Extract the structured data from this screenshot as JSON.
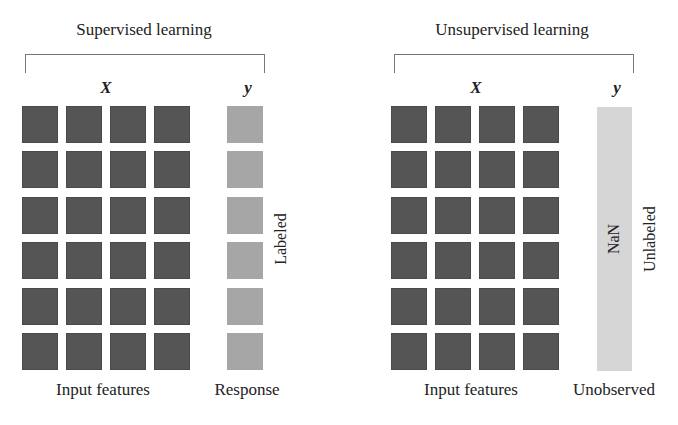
{
  "panels": [
    {
      "title": "Supervised learning",
      "x_label": "X",
      "y_label": "y",
      "feature_columns": 4,
      "rows": 6,
      "response_caption": "Response",
      "features_caption": "Input features",
      "side_label": "Labeled",
      "response_fill": "#a6a6a6"
    },
    {
      "title": "Unsupervised learning",
      "x_label": "X",
      "y_label": "y",
      "feature_columns": 4,
      "rows": 6,
      "response_caption": "Unobserved",
      "features_caption": "Input features",
      "side_label": "Unlabeled",
      "bar_text": "NaN",
      "response_fill": "#d6d6d6"
    }
  ],
  "colors": {
    "feature_cell": "#555555",
    "bracket": "#777777",
    "text": "#222222"
  }
}
